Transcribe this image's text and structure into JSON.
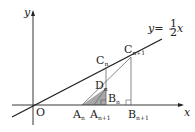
{
  "diagram": {
    "axes": {
      "x_label": "x",
      "y_label": "y",
      "origin_label": "O"
    },
    "line": {
      "label_prefix": "y=",
      "numerator": "1",
      "denominator": "2",
      "label_suffix": "x"
    },
    "points": {
      "C_n": {
        "base": "C",
        "sub": "n"
      },
      "C_n1": {
        "base": "C",
        "sub": "n+1"
      },
      "D_n": {
        "base": "D",
        "sub": "n"
      },
      "B_n": {
        "base": "B",
        "sub": "n"
      },
      "B_n1": {
        "base": "B",
        "sub": "n+1"
      },
      "A_n": {
        "base": "A",
        "sub": "n"
      },
      "A_n1": {
        "base": "A",
        "sub": "n+1"
      }
    },
    "colors": {
      "stroke": "#222222",
      "thin": "#555555",
      "shade": "#9a9a9a"
    }
  }
}
